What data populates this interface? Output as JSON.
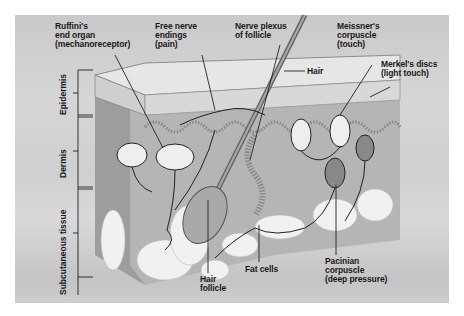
{
  "diagram": {
    "layers": [
      {
        "label": "Epidermis"
      },
      {
        "label": "Dermis"
      },
      {
        "label": "Subcutaneous tissue"
      }
    ],
    "labels": {
      "ruffini": "Ruffini's\nend organ\n(mechanoreceptor)",
      "free_nerve": "Free nerve\nendings\n(pain)",
      "nerve_plexus": "Nerve plexus\nof follicle",
      "meissner": "Meissner's\ncorpuscle\n(touch)",
      "merkel": "Merkel's discs\n(light touch)",
      "hair": "Hair",
      "hair_follicle": "Hair\nfollicle",
      "fat_cells": "Fat cells",
      "pacinian": "Pacinian\ncorpuscle\n(deep pressure)"
    },
    "colors": {
      "background": "#cfcfcf",
      "epidermis": "#e4e4e4",
      "dermis": "#b8b8b8",
      "dermis_side": "#9a9a9a",
      "fat": "#f2f2f2",
      "ink": "#1a1a1a"
    }
  }
}
